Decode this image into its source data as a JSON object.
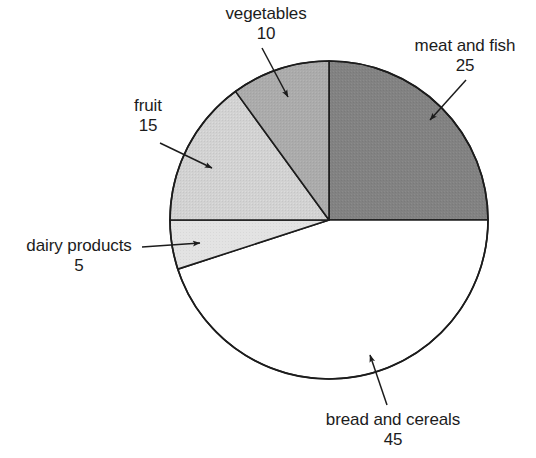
{
  "chart_data": {
    "type": "pie",
    "title": "",
    "subtitle": "",
    "xlabel": "",
    "ylabel": "",
    "total": 100,
    "units": "percent",
    "start_angle_deg": 0,
    "direction": "clockwise",
    "legend_position": "none",
    "labels_style": "callout-with-leader-arrow",
    "grid": false,
    "categories": [
      "meat and fish",
      "bread and cereals",
      "dairy products",
      "fruit",
      "vegetables"
    ],
    "values": [
      25,
      45,
      5,
      15,
      10
    ],
    "slices": [
      {
        "name": "meat-and-fish",
        "label": "meat and fish",
        "value": 25,
        "value_text": "25",
        "color": "#828282",
        "start_deg": 0,
        "end_deg": 90
      },
      {
        "name": "bread-and-cereals",
        "label": "bread and cereals",
        "value": 45,
        "value_text": "45",
        "color": "#ffffff",
        "start_deg": 90,
        "end_deg": 252
      },
      {
        "name": "dairy-products",
        "label": "dairy products",
        "value": 5,
        "value_text": "5",
        "color": "#e3e3e3",
        "start_deg": 252,
        "end_deg": 270
      },
      {
        "name": "fruit",
        "label": "fruit",
        "value": 15,
        "value_text": "15",
        "color": "#d2d2d2",
        "start_deg": 270,
        "end_deg": 324
      },
      {
        "name": "vegetables",
        "label": "vegetables",
        "value": 10,
        "value_text": "10",
        "color": "#ababab",
        "start_deg": 324,
        "end_deg": 360
      }
    ],
    "geometry": {
      "center_x": 329,
      "center_y": 220,
      "radius": 159,
      "stroke_color": "#1c1c1c",
      "stroke_width": 1.6
    }
  },
  "callouts": {
    "vegetables": {
      "label": "vegetables",
      "value": "10"
    },
    "meat_and_fish": {
      "label": "meat and fish",
      "value": "25"
    },
    "fruit": {
      "label": "fruit",
      "value": "15"
    },
    "dairy_products": {
      "label": "dairy products",
      "value": "5"
    },
    "bread_cereals": {
      "label": "bread and cereals",
      "value": "45"
    }
  }
}
